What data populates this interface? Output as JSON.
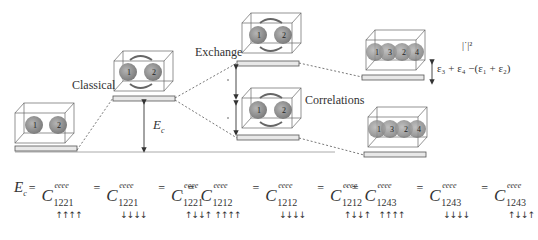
{
  "diagram": {
    "labels": {
      "classical": "Classical",
      "exchange": "Exchange",
      "correlations": "Correlations",
      "ec": "E",
      "ec_sub": "c",
      "norm": "|˙|²",
      "energy_diff": "ε₃ + ε₄ −(ε₁ + ε₂)"
    },
    "levels": [
      {
        "name": "ground",
        "particles": [
          "1",
          "2"
        ]
      },
      {
        "name": "classical",
        "particles": [
          "1",
          "2"
        ]
      },
      {
        "name": "exchange",
        "particles": [
          "1",
          "2"
        ]
      },
      {
        "name": "correlations",
        "particles": [
          "1",
          "2"
        ]
      },
      {
        "name": "excited-upper",
        "particles": [
          "1",
          "3",
          "2",
          "4"
        ]
      },
      {
        "name": "excited-lower",
        "particles": [
          "1",
          "3",
          "2",
          "4"
        ]
      }
    ],
    "equations": {
      "classical": {
        "lhs": "E",
        "lhs_sub": "c",
        "eq": "=",
        "terms": [
          {
            "C": "C",
            "sup": "eeee",
            "sub": "1221",
            "spins": "↑↑↑↑"
          },
          {
            "C": "C",
            "sup": "eeee",
            "sub": "1221",
            "spins": "↓↓↓↓"
          },
          {
            "C": "C",
            "sup": "eeee",
            "sub": "1221",
            "spins": "↑↓↓↑"
          }
        ]
      },
      "exchange": {
        "lhs": "˛",
        "eq": "=",
        "terms": [
          {
            "C": "C",
            "sup": "eeee",
            "sub": "1212",
            "spins": "↑↑↑↑"
          },
          {
            "C": "C",
            "sup": "eeee",
            "sub": "1212",
            "spins": "↓↓↓↓"
          },
          {
            "C": "C",
            "sup": "eeee",
            "sub": "1212",
            "spins": "↑↓↓↑"
          }
        ]
      },
      "correlations": {
        "lhs": "˙",
        "eq": "=",
        "terms": [
          {
            "C": "C",
            "sup": "eeee",
            "sub": "1243",
            "spins": "↑↑↑↑"
          },
          {
            "C": "C",
            "sup": "eeee",
            "sub": "1243",
            "spins": "↓↓↓↓"
          },
          {
            "C": "C",
            "sup": "eeee",
            "sub": "1243",
            "spins": "↑↓↓↑"
          }
        ]
      }
    },
    "colors": {
      "sphere": "#8a8a8a",
      "box": "#666666",
      "bar_fill": "#e8e8e8",
      "bar_stroke": "#555555",
      "dash": "#555555",
      "baseline": "#aaaaaa"
    }
  }
}
